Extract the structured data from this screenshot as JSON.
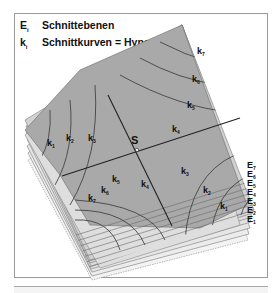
{
  "legend": {
    "rows": [
      {
        "symbol": "E",
        "subscript": "i",
        "text": "Schnittebenen"
      },
      {
        "symbol": "k",
        "subscript": "i",
        "text": "Schnittkurven = Hyperbeln"
      }
    ]
  },
  "diagram": {
    "center_label": "S",
    "plane_labels": [
      {
        "base": "E",
        "sub": "7"
      },
      {
        "base": "E",
        "sub": "6"
      },
      {
        "base": "E",
        "sub": "5"
      },
      {
        "base": "E",
        "sub": "4"
      },
      {
        "base": "E",
        "sub": "3"
      },
      {
        "base": "E",
        "sub": "2"
      },
      {
        "base": "E",
        "sub": "1"
      }
    ],
    "curve_labels_top": [
      {
        "base": "k",
        "sub": "7"
      },
      {
        "base": "k",
        "sub": "6"
      },
      {
        "base": "k",
        "sub": "5"
      },
      {
        "base": "k",
        "sub": "4"
      }
    ],
    "curve_labels_left": [
      {
        "base": "k",
        "sub": "1"
      },
      {
        "base": "k",
        "sub": "2"
      },
      {
        "base": "k",
        "sub": "3"
      }
    ],
    "curve_labels_bottom_left": [
      {
        "base": "k",
        "sub": "5"
      },
      {
        "base": "k",
        "sub": "6"
      },
      {
        "base": "k",
        "sub": "7"
      },
      {
        "base": "k",
        "sub": "4"
      }
    ],
    "curve_labels_bottom_right": [
      {
        "base": "k",
        "sub": "3"
      },
      {
        "base": "k",
        "sub": "2"
      },
      {
        "base": "k",
        "sub": "1"
      }
    ],
    "colors": {
      "plane_fill": "#a9a9a9",
      "light_plane": "#d9d9d9",
      "stack_line": "#6e6e6e",
      "curve": "#444444",
      "axis": "#222222",
      "frame": "#9a9a9a"
    }
  }
}
